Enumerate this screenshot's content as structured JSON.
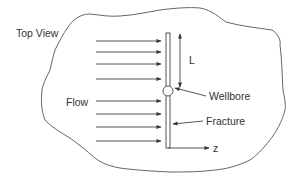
{
  "diagram": {
    "title": "Top View",
    "labels": {
      "flow": "Flow",
      "length": "L",
      "wellbore": "Wellbore",
      "fracture": "Fracture",
      "axis": "z"
    },
    "flow_arrows": {
      "count": 8,
      "direction": "right",
      "y_positions": [
        41,
        52,
        64,
        79,
        101,
        114,
        127,
        141
      ]
    },
    "colors": {
      "line": "#555555",
      "text": "#333333",
      "background": "#ffffff"
    }
  }
}
